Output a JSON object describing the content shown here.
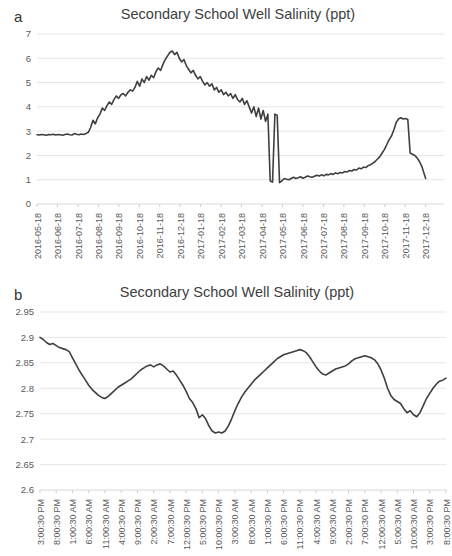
{
  "figure": {
    "panels": [
      {
        "letter": "a",
        "title": "Secondary School Well Salinity (ppt)"
      },
      {
        "letter": "b",
        "title": "Secondary School Well Salinity (ppt)"
      }
    ]
  },
  "colors": {
    "line": "#3f3f3f",
    "grid": "#e6e6e6",
    "axis": "#d9d9d9",
    "text": "#595959",
    "background": "#ffffff"
  },
  "chart_data": [
    {
      "type": "line",
      "panel": "a",
      "title": "Secondary School Well Salinity (ppt)",
      "xlabel": "",
      "ylabel": "",
      "ylim": [
        0,
        7
      ],
      "ytick_values": [
        0,
        1,
        2,
        3,
        4,
        5,
        6,
        7
      ],
      "ytick_labels": [
        "0",
        "1",
        "2",
        "3",
        "4",
        "5",
        "6",
        "7"
      ],
      "grid": true,
      "legend": "none",
      "xtick_labels": [
        "2016-05-18",
        "2016-06-18",
        "2016-07-18",
        "2016-08-18",
        "2016-09-18",
        "2016-10-18",
        "2016-11-18",
        "2016-12-18",
        "2017-01-18",
        "2017-02-18",
        "2017-03-18",
        "2017-04-18",
        "2017-05-18",
        "2017-06-18",
        "2017-07-18",
        "2017-08-18",
        "2017-09-18",
        "2017-10-18",
        "2017-11-18",
        "2017-12-18"
      ],
      "x_unit": "fraction of axis (0 = 2016-05-18, 1 = end of series)",
      "series": [
        {
          "name": "Secondary School Well Salinity (ppt)",
          "x": [
            0.0,
            0.006,
            0.012,
            0.018,
            0.024,
            0.03,
            0.036,
            0.042,
            0.048,
            0.054,
            0.06,
            0.066,
            0.072,
            0.078,
            0.084,
            0.09,
            0.096,
            0.102,
            0.108,
            0.114,
            0.12,
            0.126,
            0.132,
            0.138,
            0.144,
            0.15,
            0.156,
            0.162,
            0.168,
            0.174,
            0.18,
            0.186,
            0.192,
            0.198,
            0.204,
            0.21,
            0.216,
            0.222,
            0.228,
            0.234,
            0.24,
            0.246,
            0.252,
            0.258,
            0.264,
            0.27,
            0.276,
            0.282,
            0.288,
            0.294,
            0.3,
            0.306,
            0.312,
            0.318,
            0.324,
            0.33,
            0.336,
            0.342,
            0.348,
            0.354,
            0.36,
            0.366,
            0.372,
            0.378,
            0.384,
            0.39,
            0.396,
            0.402,
            0.408,
            0.414,
            0.42,
            0.426,
            0.432,
            0.438,
            0.444,
            0.45,
            0.456,
            0.462,
            0.468,
            0.474,
            0.48,
            0.486,
            0.492,
            0.498,
            0.504,
            0.51,
            0.516,
            0.522,
            0.528,
            0.534,
            0.54,
            0.546,
            0.552,
            0.558,
            0.564,
            0.57,
            0.576,
            0.582,
            0.588,
            0.594,
            0.6,
            0.606,
            0.612,
            0.618,
            0.624,
            0.63,
            0.636,
            0.642,
            0.648,
            0.654,
            0.66,
            0.666,
            0.672,
            0.678,
            0.684,
            0.69,
            0.696,
            0.702,
            0.708,
            0.714,
            0.72,
            0.726,
            0.732,
            0.738,
            0.744,
            0.75,
            0.756,
            0.762,
            0.768,
            0.774,
            0.78,
            0.786,
            0.792,
            0.798,
            0.804,
            0.81,
            0.816,
            0.822,
            0.828,
            0.834,
            0.84,
            0.846,
            0.852,
            0.858,
            0.864,
            0.87,
            0.876,
            0.882,
            0.888,
            0.894,
            0.9,
            0.906,
            0.912,
            0.918,
            0.924,
            0.93,
            0.936,
            0.942,
            0.948,
            0.954,
            0.96,
            0.966,
            0.972,
            0.978,
            0.984,
            0.99,
            0.995,
            1.0
          ],
          "y": [
            2.85,
            2.84,
            2.86,
            2.85,
            2.83,
            2.86,
            2.85,
            2.87,
            2.84,
            2.86,
            2.85,
            2.83,
            2.86,
            2.88,
            2.85,
            2.84,
            2.9,
            2.87,
            2.85,
            2.88,
            2.86,
            2.9,
            2.95,
            3.15,
            3.45,
            3.3,
            3.55,
            3.7,
            3.95,
            3.85,
            4.05,
            4.2,
            4.1,
            4.3,
            4.45,
            4.35,
            4.5,
            4.55,
            4.45,
            4.6,
            4.7,
            4.65,
            4.8,
            5.05,
            4.85,
            5.15,
            5.0,
            5.25,
            5.1,
            5.3,
            5.2,
            5.45,
            5.6,
            5.5,
            5.75,
            5.95,
            6.1,
            6.25,
            6.3,
            6.15,
            6.25,
            6.0,
            5.85,
            5.95,
            5.7,
            5.55,
            5.4,
            5.5,
            5.3,
            5.15,
            5.25,
            5.05,
            4.9,
            5.0,
            4.85,
            4.95,
            4.7,
            4.8,
            4.6,
            4.7,
            4.5,
            4.6,
            4.45,
            4.55,
            4.35,
            4.5,
            4.3,
            4.2,
            4.35,
            4.1,
            4.25,
            4.0,
            3.75,
            4.0,
            3.6,
            3.95,
            3.5,
            3.85,
            3.4,
            3.7,
            0.95,
            0.9,
            3.7,
            3.65,
            0.88,
            0.95,
            1.05,
            1.02,
            1.0,
            1.05,
            1.1,
            1.05,
            1.08,
            1.12,
            1.06,
            1.1,
            1.15,
            1.12,
            1.1,
            1.14,
            1.18,
            1.15,
            1.2,
            1.16,
            1.22,
            1.2,
            1.25,
            1.22,
            1.28,
            1.25,
            1.3,
            1.28,
            1.34,
            1.32,
            1.38,
            1.36,
            1.42,
            1.4,
            1.48,
            1.45,
            1.52,
            1.5,
            1.58,
            1.62,
            1.68,
            1.75,
            1.85,
            1.95,
            2.1,
            2.25,
            2.45,
            2.65,
            2.8,
            3.05,
            3.35,
            3.5,
            3.55,
            3.5,
            3.52,
            3.48,
            2.1,
            2.05,
            2.0,
            1.9,
            1.75,
            1.55,
            1.3,
            1.05
          ]
        }
      ],
      "annotations": [
        "Baseline near 2.85 ppt from 2016-05-18 to mid 2016-06",
        "Rise to maximum about 6.3 ppt near 2016-08-18",
        "Gradual decline through 2016-09 to 2016-10",
        "Abrupt drop to about 0.9 ppt near 2016-11-05 with a brief return spike to 3.7 ppt",
        "Slow recovery from 1.0 ppt to a plateau near 3.5 ppt around 2017-08",
        "Sharp fall to 2.1 ppt after the plateau then decline to 1.0 ppt by 2017-12-18"
      ]
    },
    {
      "type": "line",
      "panel": "b",
      "title": "Secondary School Well Salinity (ppt)",
      "xlabel": "",
      "ylabel": "",
      "ylim": [
        2.6,
        2.95
      ],
      "ytick_values": [
        2.6,
        2.65,
        2.7,
        2.75,
        2.8,
        2.85,
        2.9,
        2.95
      ],
      "ytick_labels": [
        "2.6",
        "2.65",
        "2.7",
        "2.75",
        "2.8",
        "2.85",
        "2.9",
        "2.95"
      ],
      "grid": true,
      "legend": "none",
      "xtick_labels": [
        "3:00:30 PM",
        "8:00:30 PM",
        "1:00:30 AM",
        "6:00:30 AM",
        "11:00:30 AM",
        "4:00:30 PM",
        "9:00:30 PM",
        "2:00:30 AM",
        "7:00:30 AM",
        "12:00:30 PM",
        "5:00:30 PM",
        "10:00:30 PM",
        "3:00:30 AM",
        "8:00:30 AM",
        "1:00:30 PM",
        "6:00:30 PM",
        "11:00:30 PM",
        "4:00:30 AM",
        "9:00:30 AM",
        "2:00:30 PM",
        "7:00:30 PM",
        "12:00:30 AM",
        "5:00:30 AM",
        "10:00:30 AM",
        "3:00:30 PM",
        "8:00:30 PM"
      ],
      "x_unit": "fraction of axis (0 = 3:00:30 PM first day, 1 = 8:00:30 PM last day)",
      "series": [
        {
          "name": "Secondary School Well Salinity (ppt)",
          "x": [
            0.0,
            0.008,
            0.016,
            0.024,
            0.032,
            0.04,
            0.048,
            0.056,
            0.064,
            0.072,
            0.08,
            0.088,
            0.096,
            0.104,
            0.112,
            0.12,
            0.128,
            0.136,
            0.144,
            0.152,
            0.16,
            0.168,
            0.176,
            0.184,
            0.192,
            0.2,
            0.208,
            0.216,
            0.224,
            0.232,
            0.24,
            0.248,
            0.256,
            0.264,
            0.272,
            0.28,
            0.288,
            0.296,
            0.304,
            0.312,
            0.32,
            0.328,
            0.336,
            0.344,
            0.352,
            0.36,
            0.368,
            0.376,
            0.384,
            0.392,
            0.4,
            0.408,
            0.416,
            0.424,
            0.432,
            0.44,
            0.448,
            0.456,
            0.464,
            0.472,
            0.48,
            0.488,
            0.496,
            0.504,
            0.512,
            0.52,
            0.528,
            0.536,
            0.544,
            0.552,
            0.56,
            0.568,
            0.576,
            0.584,
            0.592,
            0.6,
            0.608,
            0.616,
            0.624,
            0.632,
            0.64,
            0.648,
            0.656,
            0.664,
            0.672,
            0.68,
            0.688,
            0.696,
            0.704,
            0.712,
            0.72,
            0.728,
            0.736,
            0.744,
            0.752,
            0.76,
            0.768,
            0.776,
            0.784,
            0.792,
            0.8,
            0.808,
            0.816,
            0.824,
            0.832,
            0.84,
            0.848,
            0.856,
            0.864,
            0.872,
            0.88,
            0.888,
            0.896,
            0.904,
            0.912,
            0.92,
            0.928,
            0.936,
            0.944,
            0.952,
            0.96,
            0.968,
            0.976,
            0.984,
            0.992,
            1.0
          ],
          "y": [
            2.9,
            2.896,
            2.89,
            2.886,
            2.888,
            2.884,
            2.88,
            2.878,
            2.876,
            2.872,
            2.86,
            2.848,
            2.836,
            2.826,
            2.816,
            2.806,
            2.798,
            2.792,
            2.786,
            2.782,
            2.78,
            2.784,
            2.79,
            2.796,
            2.802,
            2.806,
            2.81,
            2.814,
            2.818,
            2.824,
            2.83,
            2.836,
            2.84,
            2.844,
            2.846,
            2.842,
            2.846,
            2.848,
            2.844,
            2.838,
            2.832,
            2.834,
            2.826,
            2.816,
            2.806,
            2.794,
            2.78,
            2.772,
            2.76,
            2.742,
            2.748,
            2.74,
            2.726,
            2.716,
            2.712,
            2.714,
            2.712,
            2.716,
            2.726,
            2.74,
            2.756,
            2.77,
            2.782,
            2.792,
            2.8,
            2.808,
            2.816,
            2.822,
            2.828,
            2.834,
            2.84,
            2.846,
            2.852,
            2.858,
            2.862,
            2.866,
            2.868,
            2.87,
            2.872,
            2.874,
            2.876,
            2.874,
            2.87,
            2.862,
            2.852,
            2.842,
            2.834,
            2.828,
            2.826,
            2.83,
            2.834,
            2.838,
            2.84,
            2.842,
            2.844,
            2.848,
            2.854,
            2.858,
            2.86,
            2.862,
            2.864,
            2.862,
            2.86,
            2.856,
            2.848,
            2.836,
            2.82,
            2.8,
            2.786,
            2.778,
            2.774,
            2.77,
            2.76,
            2.752,
            2.756,
            2.748,
            2.744,
            2.752,
            2.766,
            2.78,
            2.79,
            2.8,
            2.808,
            2.814,
            2.816,
            2.82
          ]
        }
      ],
      "annotations": [
        "Starts near 2.90 ppt at 3:00:30 PM",
        "First minimum about 2.78 ppt",
        "Recovery to about 2.846 ppt",
        "Deepest minimum about 2.712 ppt",
        "Rises to daily maximum near 2.876 ppt",
        "Secondary maximum near 2.864 ppt",
        "Late drop to about 2.744 ppt then recovery to 2.82 ppt at 8:00:30 PM"
      ]
    }
  ]
}
